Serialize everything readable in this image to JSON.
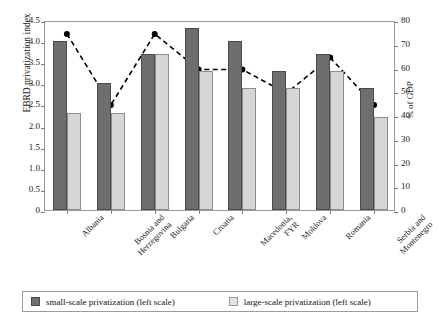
{
  "chart_data": {
    "type": "bar",
    "title": "",
    "subtitle": "",
    "xlabel": "",
    "ylabel": "EBRD privatization index",
    "y2label": "% of GDP",
    "ylim": [
      0,
      4.5
    ],
    "y2lim": [
      0,
      80
    ],
    "grid": false,
    "legend_position": "bottom",
    "categories": [
      "Albania",
      "Bosnia and Herzegovina",
      "Bulgaria",
      "Croatia",
      "Macedonia, FYR",
      "Moldova",
      "Romania",
      "Serbia and Montenegro"
    ],
    "yticks": [
      "0",
      "0.5",
      "1.0",
      "1.5",
      "2.0",
      "2.5",
      "3.0",
      "3.5",
      "4.0",
      "4.5"
    ],
    "ytick_values": [
      0,
      0.5,
      1.0,
      1.5,
      2.0,
      2.5,
      3.0,
      3.5,
      4.0,
      4.5
    ],
    "y2ticks": [
      "0",
      "10",
      "20",
      "30",
      "40",
      "50",
      "60",
      "70",
      "80"
    ],
    "y2tick_values": [
      0,
      10,
      20,
      30,
      40,
      50,
      60,
      70,
      80
    ],
    "series": [
      {
        "name": "small-scale privatization (left scale)",
        "kind": "bar",
        "axis": "left",
        "color": "#6e6e6e",
        "values": [
          4.0,
          3.0,
          3.7,
          4.3,
          4.0,
          3.3,
          3.7,
          2.9
        ]
      },
      {
        "name": "large-scale privatization (left scale)",
        "kind": "bar",
        "axis": "left",
        "color": "#d6d6d6",
        "values": [
          2.3,
          2.3,
          3.7,
          3.3,
          2.9,
          2.9,
          3.3,
          2.2
        ]
      },
      {
        "name": "private sector share (right scale)",
        "kind": "line",
        "axis": "right",
        "color": "#000000",
        "linestyle": "dashed",
        "marker": "circle",
        "values": [
          75,
          45,
          75,
          60,
          60,
          50,
          65,
          45
        ]
      }
    ]
  },
  "legend": {
    "items": [
      {
        "label": "small-scale privatization (left scale)",
        "swatch": "small"
      },
      {
        "label": "large-scale privatization (left scale)",
        "swatch": "large"
      }
    ]
  }
}
